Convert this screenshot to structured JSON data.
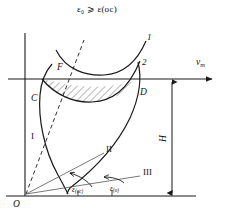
{
  "figure": {
    "title_formula": "ε₀ ⩾ ε(ос)",
    "axis": {
      "horizontal_label": "v",
      "horizontal_label_sub": "т",
      "origin_label": "O"
    },
    "curve_labels": {
      "upper_curve": "1",
      "lower_curve": "2"
    },
    "point_labels": {
      "f": "F",
      "c": "C",
      "d": "D"
    },
    "region_labels": {
      "zone_one": "I",
      "zone_two": "II",
      "zone_three": "III"
    },
    "dimension": {
      "height_label": "H"
    },
    "angles": [
      {
        "symbol": "ε",
        "subscript": "(ос)"
      },
      {
        "symbol": "ε",
        "subscript": "(о)"
      }
    ],
    "colors": {
      "stroke": "#1a1a1a",
      "hatch": "#333333",
      "background": "#ffffff"
    }
  }
}
